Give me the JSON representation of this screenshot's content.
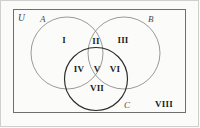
{
  "figure": {
    "type": "venn-diagram-three-set",
    "universe_label": "U",
    "set_labels": [
      {
        "name": "A",
        "text": "A"
      },
      {
        "name": "B",
        "text": "B"
      },
      {
        "name": "C",
        "text": "C"
      }
    ],
    "region_labels": [
      {
        "id": "I",
        "text": "I",
        "region": "A only"
      },
      {
        "id": "II",
        "text": "II",
        "region": "A and B only"
      },
      {
        "id": "III",
        "text": "III",
        "region": "B only"
      },
      {
        "id": "IV",
        "text": "IV",
        "region": "A and C only"
      },
      {
        "id": "V",
        "text": "V",
        "region": "A and B and C"
      },
      {
        "id": "VI",
        "text": "VI",
        "region": "B and C only"
      },
      {
        "id": "VII",
        "text": "VII",
        "region": "C only"
      },
      {
        "id": "VIII",
        "text": "VIII",
        "region": "outside all sets"
      }
    ],
    "colors": {
      "universe_border": "#6f6f6f",
      "circle_a": "#8e8e8e",
      "circle_b": "#8e8e8e",
      "circle_c": "#2b2b2b",
      "label_text": "#1d1d1d",
      "set_label_text": "#4a4a4a",
      "background": "#fbfbfa"
    }
  }
}
